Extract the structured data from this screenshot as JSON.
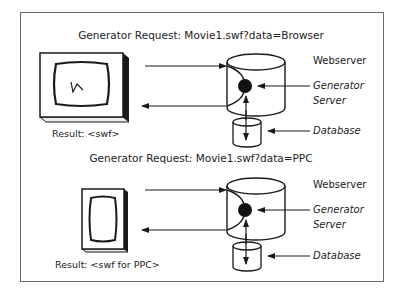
{
  "diagram": {
    "sections": [
      {
        "request_title": "Generator Request: Movie1.swf?data=Browser",
        "client": "desktop-monitor",
        "result_label": "Result: <swf>",
        "labels": {
          "webserver": "Webserver",
          "generator_line1": "Generator",
          "generator_line2": "Server",
          "database": "Database"
        }
      },
      {
        "request_title": "Generator Request: Movie1.swf?data=PPC",
        "client": "pocket-pc-device",
        "result_label": "Result: <swf for PPC>",
        "labels": {
          "webserver": "Webserver",
          "generator_line1": "Generator",
          "generator_line2": "Server",
          "database": "Database"
        }
      }
    ],
    "colors": {
      "stroke": "#1a1a1a",
      "frame": "#6a6a6a",
      "background": "#ffffff"
    }
  }
}
